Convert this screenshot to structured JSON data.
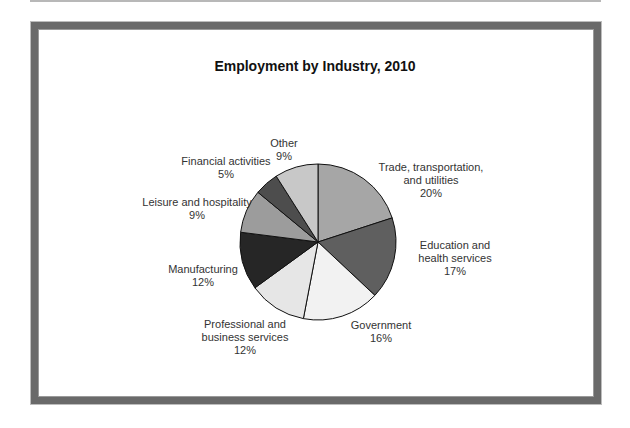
{
  "chart_data": {
    "type": "pie",
    "title": "Employment by Industry, 2010",
    "categories": [
      "Trade, transportation, and utilities",
      "Education and health services",
      "Government",
      "Professional and business services",
      "Manufacturing",
      "Leisure and hospitality",
      "Financial activities",
      "Other"
    ],
    "values": [
      20,
      17,
      16,
      12,
      12,
      9,
      5,
      9
    ],
    "unit": "%",
    "colors": [
      "#a6a6a6",
      "#5f5f5f",
      "#f2f2f2",
      "#e6e6e6",
      "#262626",
      "#9c9c9c",
      "#4d4d4d",
      "#c8c8c8"
    ],
    "start_angle_deg": 0,
    "direction": "clockwise",
    "legend": "none (data labels outside slices)"
  },
  "labels": [
    {
      "lines": [
        "Trade, transportation,",
        "and utilities",
        "20%"
      ]
    },
    {
      "lines": [
        "Education and",
        "health services",
        "17%"
      ]
    },
    {
      "lines": [
        "Government",
        "16%"
      ]
    },
    {
      "lines": [
        "Professional and",
        "business services",
        "12%"
      ]
    },
    {
      "lines": [
        "Manufacturing",
        "12%"
      ]
    },
    {
      "lines": [
        "Leisure and hospitality",
        "9%"
      ]
    },
    {
      "lines": [
        "Financial activities",
        "5%"
      ]
    },
    {
      "lines": [
        "Other",
        "9%"
      ]
    }
  ]
}
